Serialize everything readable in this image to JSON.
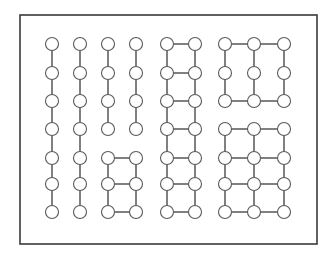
{
  "diagram": {
    "title": "",
    "colors": {
      "frame": "#3a3a3a",
      "edge": "#4a4a4a",
      "node_stroke": "#5a5a5a",
      "node_fill": "#ffffff",
      "background": "#ffffff"
    },
    "frame": {
      "x": 20,
      "y": 15,
      "width": 297,
      "height": 229
    },
    "node_radius": 6.5,
    "columns_x": [
      52,
      80,
      108,
      136,
      167,
      195,
      225,
      254,
      284
    ],
    "rows_y": [
      44,
      73,
      101,
      129,
      158,
      184,
      212
    ],
    "components": [
      {
        "name": "path-col-1",
        "nodes": [
          [
            0,
            0
          ],
          [
            0,
            1
          ],
          [
            0,
            2
          ],
          [
            0,
            3
          ],
          [
            0,
            4
          ],
          [
            0,
            5
          ],
          [
            0,
            6
          ]
        ],
        "edges": [
          [
            [
              0,
              0
            ],
            [
              0,
              1
            ]
          ],
          [
            [
              0,
              1
            ],
            [
              0,
              2
            ]
          ],
          [
            [
              0,
              2
            ],
            [
              0,
              3
            ]
          ],
          [
            [
              0,
              3
            ],
            [
              0,
              4
            ]
          ],
          [
            [
              0,
              4
            ],
            [
              0,
              5
            ]
          ],
          [
            [
              0,
              5
            ],
            [
              0,
              6
            ]
          ]
        ]
      },
      {
        "name": "path-col-2",
        "nodes": [
          [
            1,
            0
          ],
          [
            1,
            1
          ],
          [
            1,
            2
          ],
          [
            1,
            3
          ],
          [
            1,
            4
          ],
          [
            1,
            5
          ],
          [
            1,
            6
          ]
        ],
        "edges": [
          [
            [
              1,
              0
            ],
            [
              1,
              1
            ]
          ],
          [
            [
              1,
              1
            ],
            [
              1,
              2
            ]
          ],
          [
            [
              1,
              2
            ],
            [
              1,
              3
            ]
          ],
          [
            [
              1,
              3
            ],
            [
              1,
              4
            ]
          ],
          [
            [
              1,
              4
            ],
            [
              1,
              5
            ]
          ],
          [
            [
              1,
              5
            ],
            [
              1,
              6
            ]
          ]
        ]
      },
      {
        "name": "path-col-3",
        "nodes": [
          [
            2,
            0
          ],
          [
            2,
            1
          ],
          [
            2,
            2
          ],
          [
            2,
            3
          ]
        ],
        "edges": [
          [
            [
              2,
              0
            ],
            [
              2,
              1
            ]
          ],
          [
            [
              2,
              1
            ],
            [
              2,
              2
            ]
          ],
          [
            [
              2,
              2
            ],
            [
              2,
              3
            ]
          ]
        ]
      },
      {
        "name": "path-col-4",
        "nodes": [
          [
            3,
            0
          ],
          [
            3,
            1
          ],
          [
            3,
            2
          ],
          [
            3,
            3
          ]
        ],
        "edges": [
          [
            [
              3,
              0
            ],
            [
              3,
              1
            ]
          ],
          [
            [
              3,
              1
            ],
            [
              3,
              2
            ]
          ],
          [
            [
              3,
              2
            ],
            [
              3,
              3
            ]
          ]
        ]
      },
      {
        "name": "ladder-2x3",
        "nodes": [
          [
            2,
            4
          ],
          [
            3,
            4
          ],
          [
            2,
            5
          ],
          [
            3,
            5
          ],
          [
            2,
            6
          ],
          [
            3,
            6
          ]
        ],
        "edges": [
          [
            [
              2,
              4
            ],
            [
              3,
              4
            ]
          ],
          [
            [
              2,
              5
            ],
            [
              3,
              5
            ]
          ],
          [
            [
              2,
              6
            ],
            [
              3,
              6
            ]
          ],
          [
            [
              2,
              4
            ],
            [
              2,
              5
            ]
          ],
          [
            [
              2,
              5
            ],
            [
              2,
              6
            ]
          ],
          [
            [
              3,
              4
            ],
            [
              3,
              5
            ]
          ],
          [
            [
              3,
              5
            ],
            [
              3,
              6
            ]
          ]
        ]
      },
      {
        "name": "ladder-2x7",
        "nodes": [
          [
            4,
            0
          ],
          [
            5,
            0
          ],
          [
            4,
            1
          ],
          [
            5,
            1
          ],
          [
            4,
            2
          ],
          [
            5,
            2
          ],
          [
            4,
            3
          ],
          [
            5,
            3
          ],
          [
            4,
            4
          ],
          [
            5,
            4
          ],
          [
            4,
            5
          ],
          [
            5,
            5
          ],
          [
            4,
            6
          ],
          [
            5,
            6
          ]
        ],
        "edges": [
          [
            [
              4,
              0
            ],
            [
              5,
              0
            ]
          ],
          [
            [
              4,
              1
            ],
            [
              5,
              1
            ]
          ],
          [
            [
              4,
              2
            ],
            [
              5,
              2
            ]
          ],
          [
            [
              4,
              3
            ],
            [
              5,
              3
            ]
          ],
          [
            [
              4,
              4
            ],
            [
              5,
              4
            ]
          ],
          [
            [
              4,
              5
            ],
            [
              5,
              5
            ]
          ],
          [
            [
              4,
              6
            ],
            [
              5,
              6
            ]
          ],
          [
            [
              4,
              0
            ],
            [
              4,
              1
            ]
          ],
          [
            [
              4,
              1
            ],
            [
              4,
              2
            ]
          ],
          [
            [
              4,
              2
            ],
            [
              4,
              3
            ]
          ],
          [
            [
              4,
              3
            ],
            [
              4,
              4
            ]
          ],
          [
            [
              4,
              4
            ],
            [
              4,
              5
            ]
          ],
          [
            [
              4,
              5
            ],
            [
              4,
              6
            ]
          ],
          [
            [
              5,
              0
            ],
            [
              5,
              1
            ]
          ],
          [
            [
              5,
              1
            ],
            [
              5,
              2
            ]
          ],
          [
            [
              5,
              2
            ],
            [
              5,
              3
            ]
          ],
          [
            [
              5,
              3
            ],
            [
              5,
              4
            ]
          ],
          [
            [
              5,
              4
            ],
            [
              5,
              5
            ]
          ],
          [
            [
              5,
              5
            ],
            [
              5,
              6
            ]
          ]
        ]
      },
      {
        "name": "grid-3x3-open",
        "nodes": [
          [
            6,
            0
          ],
          [
            7,
            0
          ],
          [
            8,
            0
          ],
          [
            6,
            1
          ],
          [
            7,
            1
          ],
          [
            8,
            1
          ],
          [
            6,
            2
          ],
          [
            7,
            2
          ],
          [
            8,
            2
          ]
        ],
        "edges": [
          [
            [
              6,
              0
            ],
            [
              7,
              0
            ]
          ],
          [
            [
              7,
              0
            ],
            [
              8,
              0
            ]
          ],
          [
            [
              6,
              2
            ],
            [
              7,
              2
            ]
          ],
          [
            [
              7,
              2
            ],
            [
              8,
              2
            ]
          ],
          [
            [
              6,
              0
            ],
            [
              6,
              1
            ]
          ],
          [
            [
              6,
              1
            ],
            [
              6,
              2
            ]
          ],
          [
            [
              7,
              0
            ],
            [
              7,
              1
            ]
          ],
          [
            [
              7,
              1
            ],
            [
              7,
              2
            ]
          ],
          [
            [
              8,
              0
            ],
            [
              8,
              1
            ]
          ],
          [
            [
              8,
              1
            ],
            [
              8,
              2
            ]
          ]
        ]
      },
      {
        "name": "grid-3x4",
        "nodes": [
          [
            6,
            3
          ],
          [
            7,
            3
          ],
          [
            8,
            3
          ],
          [
            6,
            4
          ],
          [
            7,
            4
          ],
          [
            8,
            4
          ],
          [
            6,
            5
          ],
          [
            7,
            5
          ],
          [
            8,
            5
          ],
          [
            6,
            6
          ],
          [
            7,
            6
          ],
          [
            8,
            6
          ]
        ],
        "edges": [
          [
            [
              6,
              3
            ],
            [
              7,
              3
            ]
          ],
          [
            [
              7,
              3
            ],
            [
              8,
              3
            ]
          ],
          [
            [
              6,
              4
            ],
            [
              7,
              4
            ]
          ],
          [
            [
              7,
              4
            ],
            [
              8,
              4
            ]
          ],
          [
            [
              6,
              5
            ],
            [
              7,
              5
            ]
          ],
          [
            [
              7,
              5
            ],
            [
              8,
              5
            ]
          ],
          [
            [
              6,
              6
            ],
            [
              7,
              6
            ]
          ],
          [
            [
              7,
              6
            ],
            [
              8,
              6
            ]
          ],
          [
            [
              6,
              3
            ],
            [
              6,
              4
            ]
          ],
          [
            [
              6,
              4
            ],
            [
              6,
              5
            ]
          ],
          [
            [
              6,
              5
            ],
            [
              6,
              6
            ]
          ],
          [
            [
              7,
              3
            ],
            [
              7,
              4
            ]
          ],
          [
            [
              7,
              4
            ],
            [
              7,
              5
            ]
          ],
          [
            [
              7,
              5
            ],
            [
              7,
              6
            ]
          ],
          [
            [
              8,
              3
            ],
            [
              8,
              4
            ]
          ],
          [
            [
              8,
              4
            ],
            [
              8,
              5
            ]
          ],
          [
            [
              8,
              5
            ],
            [
              8,
              6
            ]
          ]
        ]
      }
    ]
  }
}
